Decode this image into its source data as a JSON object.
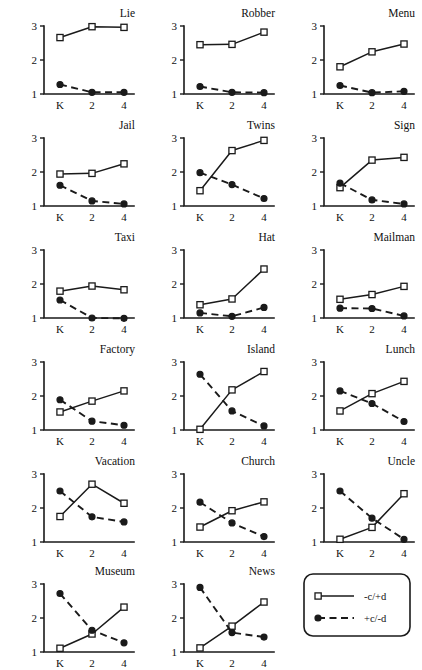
{
  "figure": {
    "axis": {
      "y_ticks": [
        "1",
        "2",
        "3"
      ],
      "y_tick_values": [
        1,
        2,
        3
      ],
      "x_ticks": [
        "K",
        "2",
        "4"
      ],
      "ylim": [
        1,
        3
      ],
      "grid": false
    },
    "legend": {
      "position": "bottom-right",
      "entries": [
        {
          "label": "-c/+d",
          "style": "solid",
          "marker": "open-square"
        },
        {
          "label": "+c/-d",
          "style": "dashed",
          "marker": "filled-circle"
        }
      ]
    }
  },
  "chart_data": {
    "type": "line",
    "title": "",
    "xlabel": "",
    "ylabel": "",
    "x": [
      "K",
      "2",
      "4"
    ],
    "ylim": [
      1,
      3
    ],
    "grid": false,
    "legend": [
      "-c/+d",
      "+c/-d"
    ],
    "panels": [
      {
        "title": "Lie",
        "series": [
          {
            "name": "-c/+d",
            "values": [
              2.66,
              2.98,
              2.96
            ]
          },
          {
            "name": "+c/-d",
            "values": [
              1.28,
              1.05,
              1.05
            ]
          }
        ]
      },
      {
        "title": "Robber",
        "series": [
          {
            "name": "-c/+d",
            "values": [
              2.45,
              2.46,
              2.82
            ]
          },
          {
            "name": "+c/-d",
            "values": [
              1.22,
              1.05,
              1.04
            ]
          }
        ]
      },
      {
        "title": "Menu",
        "series": [
          {
            "name": "-c/+d",
            "values": [
              1.8,
              2.24,
              2.47
            ]
          },
          {
            "name": "+c/-d",
            "values": [
              1.25,
              1.04,
              1.08
            ]
          }
        ]
      },
      {
        "title": "Jail",
        "series": [
          {
            "name": "-c/+d",
            "values": [
              1.94,
              1.96,
              2.24
            ]
          },
          {
            "name": "+c/-d",
            "values": [
              1.61,
              1.15,
              1.06
            ]
          }
        ]
      },
      {
        "title": "Twins",
        "series": [
          {
            "name": "-c/+d",
            "values": [
              1.45,
              2.63,
              2.93
            ]
          },
          {
            "name": "+c/-d",
            "values": [
              1.98,
              1.63,
              1.22
            ]
          }
        ]
      },
      {
        "title": "Sign",
        "series": [
          {
            "name": "-c/+d",
            "values": [
              1.54,
              2.35,
              2.43
            ]
          },
          {
            "name": "+c/-d",
            "values": [
              1.67,
              1.18,
              1.06
            ]
          }
        ]
      },
      {
        "title": "Taxi",
        "series": [
          {
            "name": "-c/+d",
            "values": [
              1.79,
              1.94,
              1.83
            ]
          },
          {
            "name": "+c/-d",
            "values": [
              1.53,
              1.0,
              0.99
            ]
          }
        ]
      },
      {
        "title": "Hat",
        "series": [
          {
            "name": "-c/+d",
            "values": [
              1.39,
              1.56,
              2.44
            ]
          },
          {
            "name": "+c/-d",
            "values": [
              1.15,
              1.05,
              1.31
            ]
          }
        ]
      },
      {
        "title": "Mailman",
        "series": [
          {
            "name": "-c/+d",
            "values": [
              1.55,
              1.69,
              1.93
            ]
          },
          {
            "name": "+c/-d",
            "values": [
              1.29,
              1.28,
              1.06
            ]
          }
        ]
      },
      {
        "title": "Factory",
        "series": [
          {
            "name": "-c/+d",
            "values": [
              1.53,
              1.85,
              2.15
            ]
          },
          {
            "name": "+c/-d",
            "values": [
              1.89,
              1.26,
              1.14
            ]
          }
        ]
      },
      {
        "title": "Island",
        "series": [
          {
            "name": "-c/+d",
            "values": [
              1.02,
              2.18,
              2.72
            ]
          },
          {
            "name": "+c/-d",
            "values": [
              2.64,
              1.56,
              1.12
            ]
          }
        ]
      },
      {
        "title": "Lunch",
        "series": [
          {
            "name": "-c/+d",
            "values": [
              1.56,
              2.07,
              2.43
            ]
          },
          {
            "name": "+c/-d",
            "values": [
              2.15,
              1.78,
              1.25
            ]
          }
        ]
      },
      {
        "title": "Vacation",
        "series": [
          {
            "name": "-c/+d",
            "values": [
              1.75,
              2.7,
              2.14
            ]
          },
          {
            "name": "+c/-d",
            "values": [
              2.5,
              1.74,
              1.59
            ]
          }
        ]
      },
      {
        "title": "Church",
        "series": [
          {
            "name": "-c/+d",
            "values": [
              1.44,
              1.92,
              2.18
            ]
          },
          {
            "name": "+c/-d",
            "values": [
              2.17,
              1.56,
              1.16
            ]
          }
        ]
      },
      {
        "title": "Uncle",
        "series": [
          {
            "name": "-c/+d",
            "values": [
              1.08,
              1.43,
              2.42
            ]
          },
          {
            "name": "+c/-d",
            "values": [
              2.5,
              1.7,
              1.08
            ]
          }
        ]
      },
      {
        "title": "Museum",
        "series": [
          {
            "name": "-c/+d",
            "values": [
              1.11,
              1.53,
              2.32
            ]
          },
          {
            "name": "+c/-d",
            "values": [
              2.72,
              1.64,
              1.27
            ]
          }
        ]
      },
      {
        "title": "News",
        "series": [
          {
            "name": "-c/+d",
            "values": [
              1.12,
              1.76,
              2.47
            ]
          },
          {
            "name": "+c/-d",
            "values": [
              2.9,
              1.57,
              1.44
            ]
          }
        ]
      }
    ]
  }
}
